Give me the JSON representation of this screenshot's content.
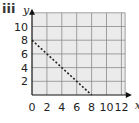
{
  "label": "iii",
  "colors": {
    "grid_bg": "#ebebeb",
    "grid_line": "#8a8a8a",
    "axis": "#111111",
    "dashed_line": "#222222"
  },
  "chart_data": {
    "type": "line",
    "title": "",
    "panel_label": "iii",
    "xlabel": "x",
    "ylabel": "y",
    "xlim": [
      0,
      13
    ],
    "ylim": [
      0,
      11
    ],
    "x_ticks": [
      0,
      2,
      4,
      6,
      8,
      10,
      12
    ],
    "y_ticks": [
      2,
      4,
      6,
      8,
      10
    ],
    "x_tick_labels": [
      "0",
      "2",
      "4",
      "6",
      "8",
      "10",
      "12"
    ],
    "y_tick_labels": [
      "2",
      "4",
      "6",
      "8",
      "10"
    ],
    "grid": true,
    "grid_spacing": 2,
    "series": [
      {
        "name": "boundary line",
        "style": "dashed",
        "x": [
          0,
          8
        ],
        "y": [
          8,
          0
        ]
      }
    ]
  }
}
